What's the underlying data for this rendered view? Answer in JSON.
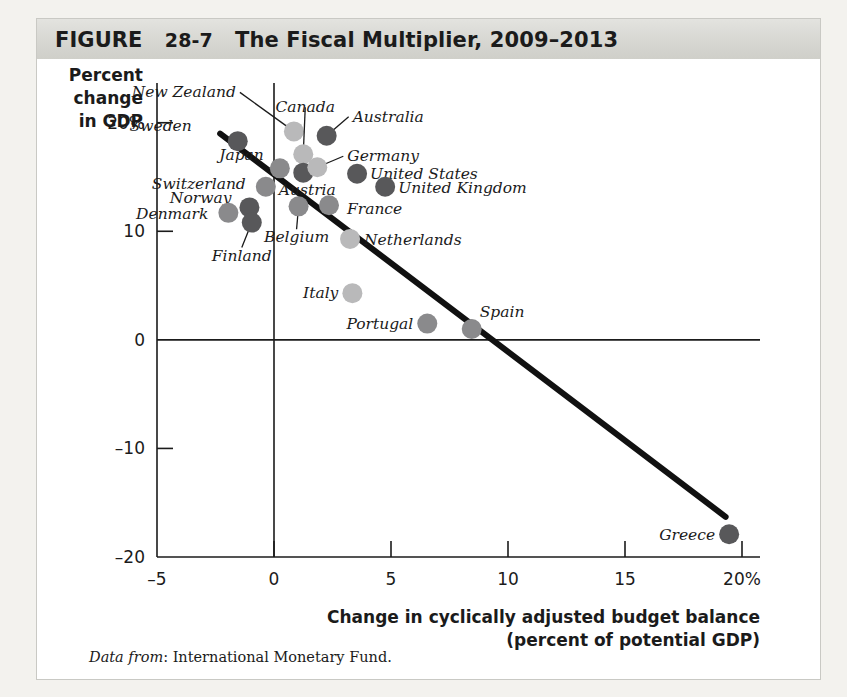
{
  "figure": {
    "label": "FIGURE",
    "number": "28-7",
    "title": "The Fiscal Multiplier, 2009–2013",
    "full_title": "FIGURE  28-7  The Fiscal Multiplier, 2009–2013",
    "source_prefix": "Data from",
    "source_text": ": International Monetary Fund.",
    "source_full": "Data from: International Monetary Fund."
  },
  "chart_data": {
    "type": "scatter",
    "title": "The Fiscal Multiplier, 2009–2013",
    "xlabel": "Change in cyclically adjusted budget balance (percent of potential GDP)",
    "xlabel_line1": "Change in cyclically adjusted budget balance",
    "xlabel_line2": "(percent of potential GDP)",
    "ylabel": "Percent change in GDP",
    "ylabel_line1": "Percent",
    "ylabel_line2": "change",
    "ylabel_line3": "in GDP",
    "xlim": [
      -5,
      20
    ],
    "ylim": [
      -20,
      22
    ],
    "xticks": [
      -5,
      0,
      5,
      10,
      15,
      20
    ],
    "xtick_labels": [
      "–5",
      "0",
      "5",
      "10",
      "15",
      "20%"
    ],
    "yticks": [
      20,
      10,
      0,
      -10,
      -20
    ],
    "ytick_labels": [
      "20%",
      "10",
      "0",
      "–10",
      "–20"
    ],
    "grid": false,
    "legend": "none",
    "trendline": {
      "label": "fiscal multiplier trend",
      "x1": -2.3,
      "y1": 19.0,
      "x2": 19.3,
      "y2": -16.3,
      "color": "#111111"
    },
    "points": [
      {
        "name": "Sweden",
        "x": -1.55,
        "y": 18.3,
        "shade": "dark",
        "label_dx": -46,
        "label_dy": -10,
        "anchor": "end",
        "leader": false
      },
      {
        "name": "New Zealand",
        "x": 0.85,
        "y": 19.2,
        "shade": "light",
        "label_dx": -58,
        "label_dy": -34,
        "anchor": "end",
        "leader": true
      },
      {
        "name": "Canada",
        "x": 1.25,
        "y": 17.1,
        "shade": "light",
        "label_dx": 2,
        "label_dy": -42,
        "anchor": "middle",
        "leader": true
      },
      {
        "name": "Australia",
        "x": 2.25,
        "y": 18.8,
        "shade": "dark",
        "label_dx": 26,
        "label_dy": -14,
        "anchor": "start",
        "leader": true
      },
      {
        "name": "Japan",
        "x": 0.25,
        "y": 15.8,
        "shade": "mid",
        "label_dx": -16,
        "label_dy": -8,
        "anchor": "end",
        "leader": false
      },
      {
        "name": "Austria",
        "x": 1.25,
        "y": 15.4,
        "shade": "dark",
        "label_dx": 4,
        "label_dy": 22,
        "anchor": "middle",
        "leader": false
      },
      {
        "name": "Germany",
        "x": 1.85,
        "y": 15.9,
        "shade": "light",
        "label_dx": 30,
        "label_dy": -6,
        "anchor": "start",
        "leader": true
      },
      {
        "name": "United States",
        "x": 3.55,
        "y": 15.3,
        "shade": "dark",
        "label_dx": 13,
        "label_dy": 5,
        "anchor": "start",
        "leader": false
      },
      {
        "name": "United Kingdom",
        "x": 4.75,
        "y": 14.1,
        "shade": "dark",
        "label_dx": 13,
        "label_dy": 6,
        "anchor": "start",
        "leader": false
      },
      {
        "name": "Switzerland",
        "x": -0.35,
        "y": 14.1,
        "shade": "mid",
        "label_dx": -20,
        "label_dy": 2,
        "anchor": "end",
        "leader": false
      },
      {
        "name": "Norway",
        "x": -1.05,
        "y": 12.2,
        "shade": "dark",
        "label_dx": -18,
        "label_dy": -4,
        "anchor": "end",
        "leader": false
      },
      {
        "name": "Denmark",
        "x": -1.95,
        "y": 11.7,
        "shade": "mid",
        "label_dx": -20,
        "label_dy": 6,
        "anchor": "end",
        "leader": false
      },
      {
        "name": "Finland",
        "x": -0.95,
        "y": 10.8,
        "shade": "dark",
        "label_dx": -10,
        "label_dy": 38,
        "anchor": "middle",
        "leader": true
      },
      {
        "name": "Belgium",
        "x": 1.05,
        "y": 12.3,
        "shade": "mid",
        "label_dx": -2,
        "label_dy": 36,
        "anchor": "middle",
        "leader": true
      },
      {
        "name": "France",
        "x": 2.35,
        "y": 12.4,
        "shade": "mid",
        "label_dx": 18,
        "label_dy": 9,
        "anchor": "start",
        "leader": false
      },
      {
        "name": "Netherlands",
        "x": 3.25,
        "y": 9.3,
        "shade": "light",
        "label_dx": 14,
        "label_dy": 6,
        "anchor": "start",
        "leader": false
      },
      {
        "name": "Italy",
        "x": 3.35,
        "y": 4.3,
        "shade": "light",
        "label_dx": -14,
        "label_dy": 5,
        "anchor": "end",
        "leader": false
      },
      {
        "name": "Portugal",
        "x": 6.55,
        "y": 1.5,
        "shade": "mid",
        "label_dx": -14,
        "label_dy": 5,
        "anchor": "end",
        "leader": false
      },
      {
        "name": "Spain",
        "x": 8.45,
        "y": 1.0,
        "shade": "mid",
        "label_dx": 8,
        "label_dy": -12,
        "anchor": "start",
        "leader": false
      },
      {
        "name": "Greece",
        "x": 19.45,
        "y": -17.9,
        "shade": "dark",
        "label_dx": -14,
        "label_dy": 6,
        "anchor": "end",
        "leader": false
      }
    ],
    "marker_colors": {
      "dark": "#58585a",
      "mid": "#8a8a8c",
      "light": "#b9b9ba"
    },
    "marker_radius": 10
  }
}
